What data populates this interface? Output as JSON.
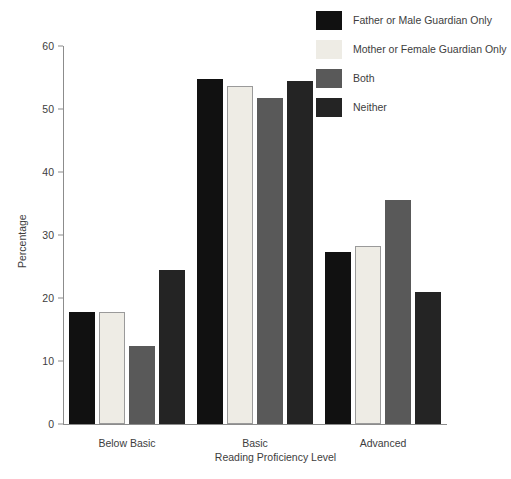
{
  "chart_data": {
    "type": "bar",
    "title": "",
    "xlabel": "Reading Proficiency Level",
    "ylabel": "Percentage",
    "categories": [
      "Below Basic",
      "Basic",
      "Advanced"
    ],
    "ylim": [
      0,
      60
    ],
    "yticks": [
      0,
      10,
      20,
      30,
      40,
      50,
      60
    ],
    "grid": false,
    "legend_position": "top-right",
    "series": [
      {
        "name": "Father or Male Guardian Only",
        "color": "#111111",
        "values": [
          17.8,
          54.8,
          27.3
        ]
      },
      {
        "name": "Mother or Female Guardian Only",
        "color": "#eeece5",
        "values": [
          17.8,
          53.6,
          28.3
        ]
      },
      {
        "name": "Both",
        "color": "#595959",
        "values": [
          12.4,
          51.8,
          35.5
        ]
      },
      {
        "name": "Neither",
        "color": "#242424",
        "values": [
          24.4,
          54.4,
          20.9
        ]
      }
    ]
  }
}
